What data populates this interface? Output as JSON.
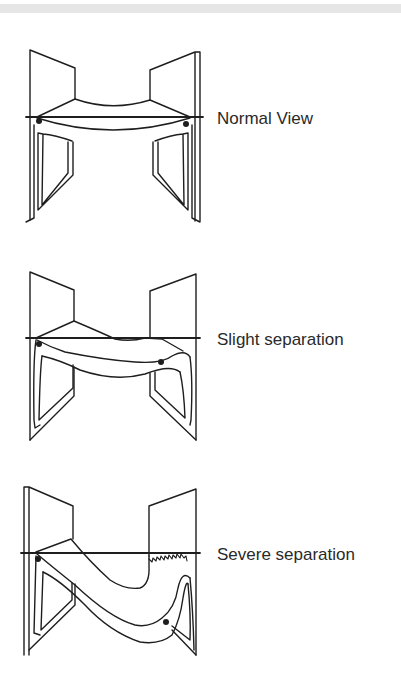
{
  "diagram": {
    "panels": [
      {
        "id": "normal",
        "label": "Normal View"
      },
      {
        "id": "slight",
        "label": "Slight separation"
      },
      {
        "id": "severe",
        "label": "Severe separation"
      }
    ]
  }
}
